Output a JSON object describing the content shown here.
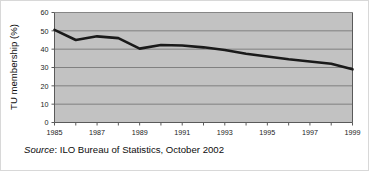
{
  "chart_data": {
    "type": "line",
    "title": "",
    "xlabel": "",
    "ylabel": "TU membership (%)",
    "xlim": [
      1985,
      1999
    ],
    "ylim": [
      0,
      60
    ],
    "grid": true,
    "legend": "none",
    "x": [
      1985,
      1986,
      1987,
      1988,
      1989,
      1990,
      1991,
      1992,
      1993,
      1994,
      1995,
      1996,
      1997,
      1998,
      1999
    ],
    "values": [
      50.5,
      45.0,
      47.0,
      46.0,
      40.3,
      42.3,
      42.0,
      41.0,
      39.5,
      37.5,
      36.0,
      34.5,
      33.3,
      32.0,
      29.0
    ],
    "series": [
      {
        "name": "TU membership",
        "values": [
          50.5,
          45.0,
          47.0,
          46.0,
          40.3,
          42.3,
          42.0,
          41.0,
          39.5,
          37.5,
          36.0,
          34.5,
          33.3,
          32.0,
          29.0
        ]
      }
    ],
    "x_tick_labels": [
      "1985",
      "1987",
      "1989",
      "1991",
      "1993",
      "1995",
      "1997",
      "1999"
    ],
    "x_tick_values": [
      1985,
      1987,
      1989,
      1991,
      1993,
      1995,
      1997,
      1999
    ],
    "y_tick_labels": [
      "0",
      "10",
      "20",
      "30",
      "40",
      "50",
      "60"
    ],
    "y_tick_values": [
      0,
      10,
      20,
      30,
      40,
      50,
      60
    ],
    "colors": {
      "line": "#1a1a1a",
      "plot_background": "#c2c2c2",
      "grid": "#6e6e6e",
      "axis": "#5a5a5a",
      "text": "#0d0d0d",
      "figure_background": "#ffffff"
    }
  },
  "caption": {
    "source_word": "Source",
    "source_text": ": ILO Bureau of Statistics, October 2002",
    "full": "Source: ILO Bureau of Statistics, October 2002"
  }
}
